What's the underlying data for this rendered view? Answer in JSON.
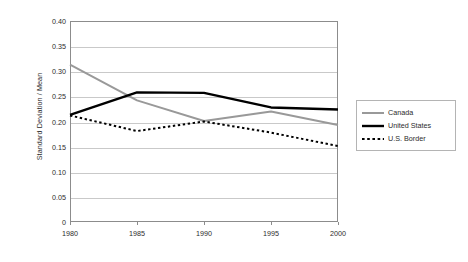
{
  "chart_data": {
    "type": "line",
    "title": "",
    "xlabel": "",
    "ylabel": "Standard Deviation / Mean",
    "x": [
      1980,
      1985,
      1990,
      1995,
      2000
    ],
    "xtick_labels": [
      "1980",
      "1985",
      "1990",
      "1995",
      "2000"
    ],
    "ytick_labels": [
      "0.40",
      "0.35",
      "0.30",
      "0.25",
      "0.20",
      "0.15",
      "0.10",
      "0.05",
      "0"
    ],
    "ytick_values": [
      0.4,
      0.35,
      0.3,
      0.25,
      0.2,
      0.15,
      0.1,
      0.05,
      0
    ],
    "ylim": [
      0,
      0.4
    ],
    "xlim": [
      1980,
      2000
    ],
    "grid": "horizontal",
    "legend_position": "right",
    "series": [
      {
        "name": "Canada",
        "values": [
          0.313,
          0.242,
          0.201,
          0.22,
          0.193
        ],
        "color": "#999999",
        "style": "solid",
        "width": 2.0
      },
      {
        "name": "United States",
        "values": [
          0.213,
          0.258,
          0.257,
          0.228,
          0.224
        ],
        "color": "#000000",
        "style": "solid",
        "width": 2.4
      },
      {
        "name": "U.S. Border",
        "values": [
          0.212,
          0.181,
          0.2,
          0.178,
          0.151
        ],
        "color": "#000000",
        "style": "dotted",
        "width": 2.0
      }
    ]
  },
  "legend": {
    "items": [
      {
        "label": "Canada",
        "icon": "gray-solid-line-icon"
      },
      {
        "label": "United States",
        "icon": "black-solid-line-icon"
      },
      {
        "label": "U.S. Border",
        "icon": "black-dotted-line-icon"
      }
    ]
  },
  "colors": {
    "canada": "#999999",
    "united_states": "#000000",
    "us_border": "#000000",
    "grid": "#c9c9c9",
    "frame": "#8c8c8c",
    "text": "#2b2b2b",
    "background": "#ffffff"
  }
}
